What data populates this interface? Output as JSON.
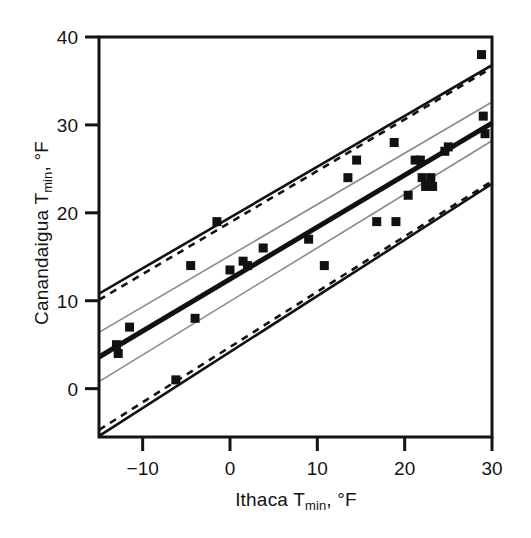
{
  "figure": {
    "background_color": "#ffffff",
    "ink_color": "#141414",
    "band_gray_color": "#8a8a8a"
  },
  "axes": {
    "x": {
      "label_main": "Ithaca T",
      "label_sub": "min",
      "label_tail": ", °F",
      "ticks": [
        "−10",
        "0",
        "10",
        "20",
        "30"
      ],
      "tick_values": [
        -10,
        0,
        10,
        20,
        30
      ],
      "min": -15,
      "max": 30
    },
    "y": {
      "label_main": "Canandaigua T",
      "label_sub": "min",
      "label_tail": ", °F",
      "ticks": [
        "40",
        "30",
        "20",
        "10",
        "0"
      ],
      "tick_values": [
        40,
        30,
        20,
        10,
        0
      ],
      "min": -5.5,
      "max": 40
    }
  },
  "chart_data": {
    "type": "scatter",
    "title": "",
    "xlabel": "Ithaca T_min, °F",
    "ylabel": "Canandaigua T_min, °F",
    "xlim": [
      -15,
      30
    ],
    "ylim": [
      -5.5,
      40
    ],
    "grid": false,
    "legend": "none",
    "marker": "filled-square",
    "marker_color": "#111111",
    "points": [
      [
        -13.0,
        5.0
      ],
      [
        -12.8,
        4.0
      ],
      [
        -11.5,
        7.0
      ],
      [
        -6.2,
        1.0
      ],
      [
        -4.5,
        14.0
      ],
      [
        -4.0,
        8.0
      ],
      [
        -1.5,
        19.0
      ],
      [
        0.0,
        13.5
      ],
      [
        1.5,
        14.5
      ],
      [
        2.0,
        14.0
      ],
      [
        3.8,
        16.0
      ],
      [
        9.0,
        17.0
      ],
      [
        10.8,
        14.0
      ],
      [
        13.5,
        24.0
      ],
      [
        14.5,
        26.0
      ],
      [
        16.8,
        19.0
      ],
      [
        18.8,
        28.0
      ],
      [
        19.0,
        19.0
      ],
      [
        20.4,
        22.0
      ],
      [
        21.2,
        26.0
      ],
      [
        21.8,
        26.0
      ],
      [
        22.0,
        24.0
      ],
      [
        22.4,
        23.0
      ],
      [
        23.0,
        24.0
      ],
      [
        23.2,
        23.0
      ],
      [
        24.6,
        27.0
      ],
      [
        25.0,
        27.5
      ],
      [
        28.8,
        38.0
      ],
      [
        29.0,
        31.0
      ],
      [
        29.2,
        29.0
      ]
    ],
    "lines": [
      {
        "name": "regression-line",
        "style": "solid-thick",
        "color": "#111111",
        "width": 5,
        "x": [
          -15,
          30
        ],
        "y": [
          3.6,
          30.2
        ]
      },
      {
        "name": "confidence-band-upper",
        "style": "solid-thin-gray",
        "color": "#8a8a8a",
        "width": 1.6,
        "x": [
          -15,
          30
        ],
        "y": [
          6.4,
          32.6
        ]
      },
      {
        "name": "confidence-band-lower",
        "style": "solid-thin-gray",
        "color": "#8a8a8a",
        "width": 1.6,
        "x": [
          -15,
          30
        ],
        "y": [
          0.8,
          28.2
        ]
      },
      {
        "name": "prediction-band-upper-solid",
        "style": "solid",
        "color": "#111111",
        "width": 2.6,
        "x": [
          -15,
          30
        ],
        "y": [
          10.8,
          36.8
        ]
      },
      {
        "name": "prediction-band-upper-dashed",
        "style": "dashed",
        "color": "#111111",
        "width": 2.6,
        "x": [
          -15,
          30
        ],
        "y": [
          10.1,
          36.5
        ]
      },
      {
        "name": "prediction-band-lower-solid",
        "style": "solid",
        "color": "#111111",
        "width": 2.6,
        "x": [
          -15,
          30
        ],
        "y": [
          -5.4,
          23.3
        ]
      },
      {
        "name": "prediction-band-lower-dashed",
        "style": "dashed",
        "color": "#111111",
        "width": 2.6,
        "x": [
          -15,
          30
        ],
        "y": [
          -4.7,
          23.6
        ]
      }
    ]
  }
}
